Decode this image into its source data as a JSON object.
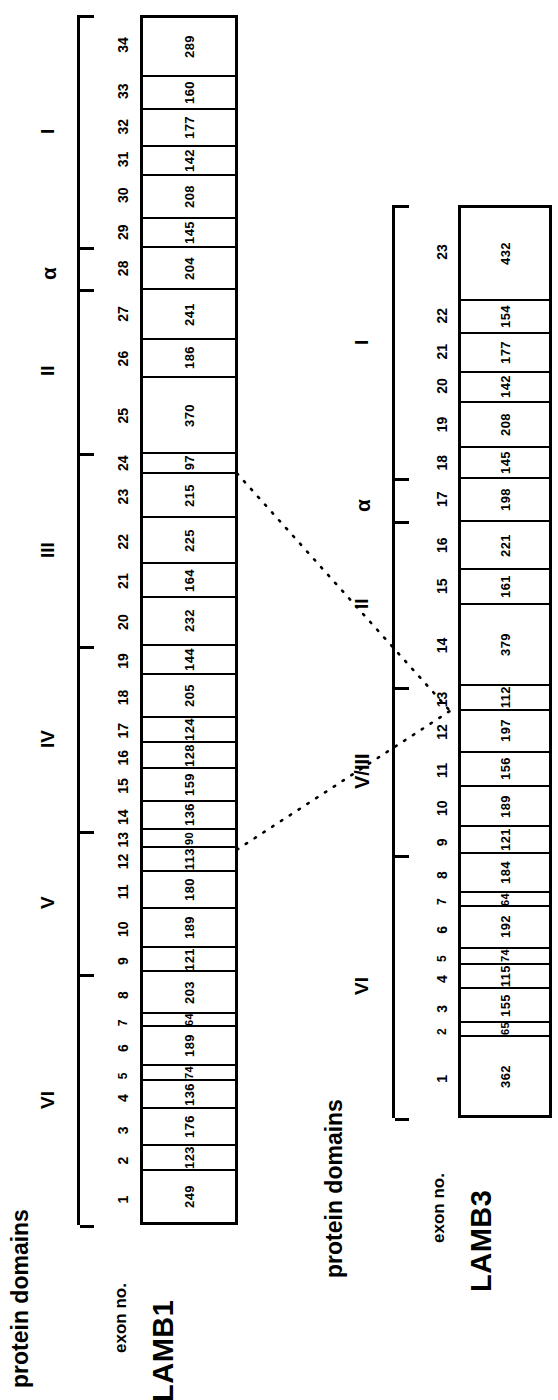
{
  "figure": {
    "orientation": "rotated-90-text-reads-bottom-to-top",
    "captions": {
      "protein_domains": "protein\ndomains",
      "exon_no": "exon no.",
      "connector_note": "dotted lines"
    }
  },
  "genes": [
    {
      "name": "LAMB1",
      "exon_count": 34,
      "exon_numbers": [
        "1",
        "2",
        "3",
        "4",
        "5",
        "6",
        "7",
        "8",
        "9",
        "10",
        "11",
        "12",
        "13",
        "14",
        "15",
        "16",
        "17",
        "18",
        "19",
        "20",
        "21",
        "22",
        "23",
        "24",
        "25",
        "26",
        "27",
        "28",
        "29",
        "30",
        "31",
        "32",
        "33",
        "34"
      ],
      "exon_sizes": [
        249,
        123,
        176,
        136,
        74,
        189,
        64,
        203,
        121,
        189,
        180,
        113,
        90,
        136,
        159,
        128,
        124,
        205,
        144,
        232,
        164,
        225,
        215,
        97,
        370,
        186,
        241,
        204,
        145,
        208,
        142,
        177,
        160,
        289
      ],
      "domains": [
        {
          "label": "VI",
          "first_exon": 1,
          "last_exon": 8
        },
        {
          "label": "V",
          "first_exon": 9,
          "last_exon": 13
        },
        {
          "label": "IV",
          "first_exon": 14,
          "last_exon": 19
        },
        {
          "label": "III",
          "first_exon": 20,
          "last_exon": 24
        },
        {
          "label": "II",
          "first_exon": 25,
          "last_exon": 27
        },
        {
          "label": "α",
          "first_exon": 28,
          "last_exon": 28
        },
        {
          "label": "I",
          "first_exon": 29,
          "last_exon": 34
        }
      ]
    },
    {
      "name": "LAMB3",
      "exon_count": 23,
      "exon_numbers": [
        "1",
        "2",
        "3",
        "4",
        "5",
        "6",
        "7",
        "8",
        "9",
        "10",
        "11",
        "12",
        "13",
        "14",
        "15",
        "16",
        "17",
        "18",
        "19",
        "20",
        "21",
        "22",
        "23"
      ],
      "exon_numbers_display": [
        "1",
        "2",
        "3",
        "4",
        "5",
        "6",
        "7",
        "8",
        "9",
        "10",
        "11",
        "12",
        "13",
        "14",
        "15",
        "16",
        "17",
        "18",
        "19",
        "20",
        "21",
        "22",
        "23"
      ],
      "exon_sizes": [
        362,
        65,
        155,
        115,
        74,
        192,
        64,
        184,
        121,
        189,
        156,
        197,
        112,
        379,
        161,
        221,
        198,
        145,
        208,
        142,
        177,
        154,
        432
      ],
      "domains": [
        {
          "label": "VI",
          "first_exon": 1,
          "last_exon": 8
        },
        {
          "label": "V/III",
          "first_exon": 9,
          "last_exon": 13
        },
        {
          "label": "II",
          "first_exon": 14,
          "last_exon": 16
        },
        {
          "label": "α",
          "first_exon": 17,
          "last_exon": 17
        },
        {
          "label": "I",
          "first_exon": 18,
          "last_exon": 23
        }
      ]
    }
  ],
  "connectors": [
    {
      "from_gene": "LAMB1",
      "from_exon_boundary": "23/24",
      "to_gene": "LAMB3",
      "to_exon_boundary": "12/13"
    },
    {
      "from_gene": "LAMB1",
      "from_exon_boundary": "12/13",
      "to_gene": "LAMB3",
      "to_exon_boundary": "12/13"
    }
  ],
  "style": {
    "stroke": "#000000",
    "background": "#ffffff"
  }
}
